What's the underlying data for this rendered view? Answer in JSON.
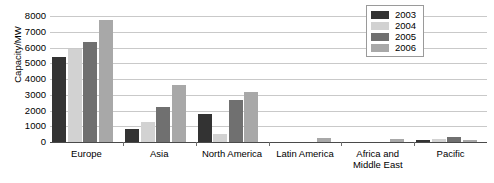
{
  "chart_data": {
    "type": "bar",
    "title": "",
    "xlabel": "",
    "ylabel": "Capacity/MW",
    "ylim": [
      0,
      8000
    ],
    "ytick_step": 1000,
    "yticks": [
      8000,
      7000,
      6000,
      5000,
      4000,
      3000,
      2000,
      1000,
      0
    ],
    "grid": true,
    "legend_position": "top-right",
    "categories": [
      "Europe",
      "Asia",
      "North America",
      "Latin America",
      "Africa and Middle East",
      "Pacific"
    ],
    "series": [
      {
        "name": "2003",
        "color": "#333333",
        "values": [
          5400,
          800,
          1800,
          0,
          0,
          150
        ]
      },
      {
        "name": "2004",
        "color": "#d2d2d2",
        "values": [
          5900,
          1250,
          500,
          0,
          0,
          200
        ]
      },
      {
        "name": "2005",
        "color": "#707070",
        "values": [
          6350,
          2200,
          2650,
          0,
          0,
          350
        ]
      },
      {
        "name": "2006",
        "color": "#a8a8a8",
        "values": [
          7750,
          3650,
          3200,
          250,
          200,
          120
        ]
      }
    ]
  }
}
